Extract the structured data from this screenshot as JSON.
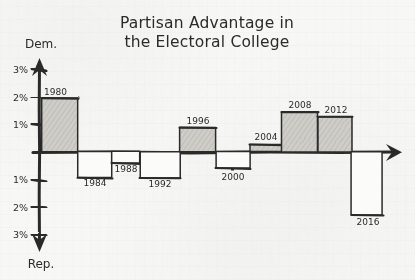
{
  "chart_data": {
    "type": "bar",
    "title": "Partisan Advantage in the Electoral College",
    "title_line1": "Partisan Advantage in",
    "title_line2": "the Electoral College",
    "xlabel": "",
    "ylabel": "",
    "axis_top_label": "Dem.",
    "axis_bottom_label": "Rep.",
    "ylim": [
      -3.2,
      3.2
    ],
    "grid": false,
    "legend": "none",
    "y_tick_labels": [
      "3%",
      "2%",
      "1%",
      "1%",
      "2%",
      "3%"
    ],
    "y_tick_values": [
      3,
      2,
      1,
      -1,
      -2,
      -3
    ],
    "categories": [
      "1980",
      "1984",
      "1988",
      "1992",
      "1996",
      "2000",
      "2004",
      "2008",
      "2012",
      "2016"
    ],
    "values": [
      1.95,
      -0.95,
      -0.42,
      -0.95,
      0.88,
      -0.6,
      0.26,
      1.45,
      1.28,
      -2.3
    ],
    "fill_flags": [
      true,
      false,
      false,
      false,
      true,
      false,
      true,
      true,
      true,
      false
    ],
    "note": "Positive values favor Dem., negative values favor Rep.; shaded bars are Democratic advantage"
  },
  "colors": {
    "ink": "#2b2b2b",
    "paper": "#f7f7f5",
    "bar_fill_shaded": "#c9c7c2",
    "bar_fill_open": "#fbfbf9"
  },
  "bars": [
    {
      "year": "1980",
      "value": 1.95,
      "shaded": true,
      "x": 42,
      "w": 36,
      "label_x": 58,
      "label_y": 95,
      "label_anchor": "start",
      "label_dx": -14
    },
    {
      "year": "1984",
      "value": -0.95,
      "shaded": false,
      "x": 78,
      "w": 34,
      "label_x": 95,
      "label_y": 186,
      "label_anchor": "middle",
      "label_dx": 0
    },
    {
      "year": "1988",
      "value": -0.42,
      "shaded": false,
      "x": 112,
      "w": 28,
      "label_x": 126,
      "label_y": 172,
      "label_anchor": "middle",
      "label_dx": 0
    },
    {
      "year": "1992",
      "value": -0.95,
      "shaded": false,
      "x": 140,
      "w": 40,
      "label_x": 160,
      "label_y": 187,
      "label_anchor": "middle",
      "label_dx": 0
    },
    {
      "year": "1996",
      "value": 0.88,
      "shaded": true,
      "x": 180,
      "w": 36,
      "label_x": 198,
      "label_y": 124,
      "label_anchor": "middle",
      "label_dx": 0
    },
    {
      "year": "2000",
      "value": -0.6,
      "shaded": false,
      "x": 216,
      "w": 34,
      "label_x": 233,
      "label_y": 180,
      "label_anchor": "middle",
      "label_dx": 0
    },
    {
      "year": "2004",
      "value": 0.26,
      "shaded": true,
      "x": 250,
      "w": 32,
      "label_x": 266,
      "label_y": 140,
      "label_anchor": "middle",
      "label_dx": 0
    },
    {
      "year": "2008",
      "value": 1.45,
      "shaded": true,
      "x": 282,
      "w": 36,
      "label_x": 300,
      "label_y": 108,
      "label_anchor": "middle",
      "label_dx": 0
    },
    {
      "year": "2012",
      "value": 1.28,
      "shaded": true,
      "x": 318,
      "w": 34,
      "label_x": 336,
      "label_y": 113,
      "label_anchor": "middle",
      "label_dx": 0
    },
    {
      "year": "2016",
      "value": -2.3,
      "shaded": false,
      "x": 352,
      "w": 31,
      "label_x": 368,
      "label_y": 225,
      "label_anchor": "middle",
      "label_dx": 0
    }
  ],
  "geometry": {
    "zero_y": 152,
    "axis_x": 39,
    "px_per_percent": 27.5,
    "x_axis_end": 402,
    "y_axis_top": 62,
    "y_axis_bottom": 248
  }
}
